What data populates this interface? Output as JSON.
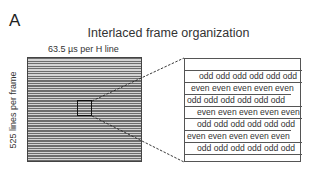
{
  "panel_letter": "A",
  "title": "Interlaced frame organization",
  "horizontal_label": "63.5  µs per H line",
  "vertical_label": "525 lines per frame",
  "detail_rows": [
    {
      "text": "",
      "offset": 0,
      "width": 117
    },
    {
      "text": "odd odd odd odd odd odd",
      "offset": 14,
      "width": 117
    },
    {
      "text": "even even even even even",
      "offset": 6,
      "width": 117
    },
    {
      "text": "odd odd odd odd odd odd",
      "offset": 2,
      "width": 106
    },
    {
      "text": "even even even even even",
      "offset": 12,
      "width": 117
    },
    {
      "text": "odd odd odd odd odd odd",
      "offset": 12,
      "width": 117
    },
    {
      "text": "even even even even even",
      "offset": 2,
      "width": 106
    },
    {
      "text": "odd odd odd odd odd odd",
      "offset": 12,
      "width": 117
    },
    {
      "text": "",
      "offset": 0,
      "width": 117
    }
  ],
  "colors": {
    "line_dark": "#6d6d6d",
    "line_light": "#d4d4d4",
    "border": "#444444"
  }
}
